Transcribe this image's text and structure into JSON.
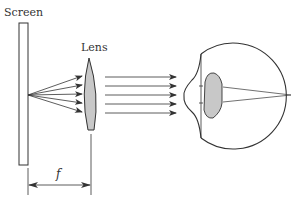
{
  "diagram": {
    "labels": {
      "screen": "Screen",
      "lens": "Lens",
      "focal_length": "f"
    },
    "colors": {
      "stroke": "#333333",
      "lens_fill": "#c8c8c8",
      "eye_lens_fill": "#c8c8c8",
      "background": "#ffffff"
    },
    "rays": {
      "diverging_count": 5,
      "parallel_count": 5
    }
  }
}
